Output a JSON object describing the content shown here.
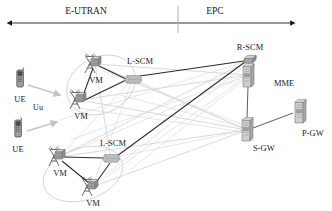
{
  "figure": {
    "width": 332,
    "height": 211,
    "background_color": "#ffffff"
  },
  "domains": {
    "axis_label": "domain-span-arrow",
    "left": {
      "label": "E-UTRAN",
      "x": 86,
      "y": 11
    },
    "right": {
      "label": "EPC",
      "x": 215,
      "y": 11
    },
    "divider": {
      "x": 178,
      "y1": 6,
      "y2": 33
    },
    "arrow": {
      "x1": 12,
      "x2": 292,
      "y": 23
    }
  },
  "interfaces": [
    {
      "name": "Uu",
      "label": "Uu",
      "x": 38,
      "y": 107
    }
  ],
  "colors": {
    "dark_link": "#2b2b2b",
    "mesh_link": "#c9c9c9",
    "cluster_outline": "#cfcfcf",
    "node_fill": "#b9b9b9",
    "node_fill_light": "#d8d8d8",
    "node_stroke": "#6e6e6e",
    "text": "#1a1a1a",
    "uu_arrow": "#c5c5c5"
  },
  "nodes": [
    {
      "id": "ue-1",
      "type": "ue",
      "icon": "mobile-phone-icon",
      "label": "UE",
      "x": 20,
      "y": 78,
      "label_x": 20,
      "label_y": 99
    },
    {
      "id": "ue-2",
      "type": "ue",
      "icon": "mobile-phone-icon",
      "label": "UE",
      "x": 18,
      "y": 128,
      "label_x": 18,
      "label_y": 149
    },
    {
      "id": "vm-1",
      "type": "vm",
      "icon": "antenna-tower-icon",
      "label": "VM",
      "x": 95,
      "y": 64,
      "label_x": 96,
      "label_y": 83
    },
    {
      "id": "vm-2",
      "type": "vm",
      "icon": "antenna-tower-icon",
      "label": "VM",
      "x": 80,
      "y": 100,
      "label_x": 80,
      "label_y": 119
    },
    {
      "id": "vm-3",
      "type": "vm",
      "icon": "antenna-tower-icon",
      "label": "VM",
      "x": 59,
      "y": 157,
      "label_x": 59,
      "label_y": 176
    },
    {
      "id": "vm-4",
      "type": "vm",
      "icon": "antenna-tower-icon",
      "label": "VM",
      "x": 92,
      "y": 187,
      "label_x": 92,
      "label_y": 205
    },
    {
      "id": "lscm-1",
      "type": "lscm",
      "icon": "switch-box-icon",
      "label": "L-SCM",
      "x": 133,
      "y": 79,
      "label_x": 140,
      "label_y": 63
    },
    {
      "id": "lscm-2",
      "type": "lscm",
      "icon": "switch-box-icon",
      "label": "L-SCM",
      "x": 111,
      "y": 158,
      "label_x": 113,
      "label_y": 144
    },
    {
      "id": "rscm",
      "type": "rscm",
      "icon": "cube-box-icon",
      "label": "R-SCM",
      "x": 250,
      "y": 60,
      "label_x": 256,
      "label_y": 48
    },
    {
      "id": "mme",
      "type": "server",
      "icon": "server-rack-icon",
      "label": "MME",
      "x": 248,
      "y": 75,
      "label_x": 272,
      "label_y": 83
    },
    {
      "id": "sgw",
      "type": "server",
      "icon": "server-rack-icon",
      "label": "S-GW",
      "x": 247,
      "y": 130,
      "label_x": 267,
      "label_y": 146
    },
    {
      "id": "pgw",
      "type": "server",
      "icon": "server-rack-icon",
      "label": "P-GW",
      "x": 300,
      "y": 111,
      "label_x": 308,
      "label_y": 130
    }
  ],
  "clusters": [
    {
      "id": "cluster-1",
      "label": "enb-cluster-top",
      "cx": 101,
      "cy": 85,
      "rx": 36,
      "ry": 28,
      "rotate": -28
    },
    {
      "id": "cluster-2",
      "label": "enb-cluster-bottom",
      "cx": 83,
      "cy": 174,
      "rx": 41,
      "ry": 26,
      "rotate": -18
    }
  ],
  "dark_links": [
    {
      "from": "vm-1",
      "to": "lscm-1"
    },
    {
      "from": "vm-2",
      "to": "lscm-1"
    },
    {
      "from": "vm-1",
      "to": "vm-2"
    },
    {
      "from": "vm-3",
      "to": "lscm-2"
    },
    {
      "from": "vm-4",
      "to": "lscm-2"
    },
    {
      "from": "vm-3",
      "to": "vm-4"
    },
    {
      "from": "lscm-1",
      "to": "rscm"
    },
    {
      "from": "lscm-2",
      "to": "rscm"
    },
    {
      "from": "rscm",
      "to": "mme"
    },
    {
      "from": "mme",
      "to": "sgw"
    },
    {
      "from": "sgw",
      "to": "pgw"
    }
  ],
  "uu_arrows": [
    {
      "from": "ue-1",
      "to": "vm-2"
    },
    {
      "from": "ue-2",
      "to": "vm-3"
    }
  ]
}
